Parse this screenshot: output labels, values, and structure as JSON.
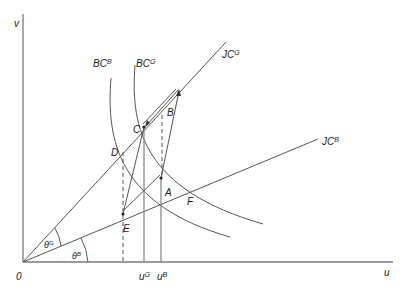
{
  "diagram": {
    "axes": {
      "x_label": "u",
      "y_label": "v",
      "origin_label": "0"
    },
    "curves": {
      "bc_b": "BC",
      "bc_b_sup": "B",
      "bc_g": "BC",
      "bc_g_sup": "G",
      "jc_g": "JC",
      "jc_g_sup": "G",
      "jc_b": "JC",
      "jc_b_sup": "B"
    },
    "points": {
      "A": "A",
      "B": "B",
      "C": "C",
      "D": "D",
      "E": "E",
      "F": "F"
    },
    "angles": {
      "theta_g": "θ",
      "theta_g_sup": "G",
      "theta_b": "θ",
      "theta_b_sup": "B"
    },
    "x_ticks": {
      "u_g": "u",
      "u_g_sup": "G",
      "u_b": "u",
      "u_b_sup": "B"
    },
    "colors": {
      "axis": "#7a7a7a",
      "line": "#555555",
      "text": "#1a1a1a"
    }
  }
}
